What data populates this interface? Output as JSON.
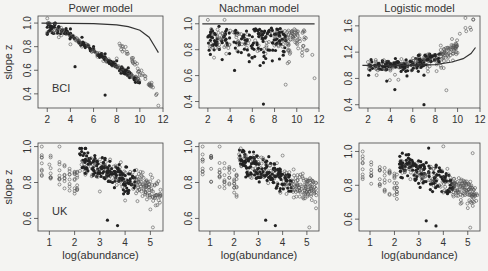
{
  "figure": {
    "row_labels": [
      "BCI",
      "UK"
    ],
    "column_titles": [
      "Power model",
      "Nachman model",
      "Logistic model"
    ],
    "ylabel": "slope z",
    "xlabel": "log(abundance)"
  },
  "chart_data": [
    {
      "type": "scatter",
      "title": "Power model",
      "panel_label": "BCI",
      "xlabel": "",
      "ylabel": "slope z",
      "xlim": [
        1.2,
        12
      ],
      "ylim": [
        0.28,
        1.06
      ],
      "xticks": [
        2,
        4,
        6,
        8,
        10,
        12
      ],
      "yticks": [
        0.4,
        0.6,
        0.8,
        1.0
      ],
      "series": [
        {
          "name": "filled points",
          "trend": "declining from ~1.0 at x=2 to ~0.6 at x=9.5",
          "example_points": [
            [
              3,
              0.97
            ],
            [
              4,
              0.95
            ],
            [
              5,
              0.88
            ],
            [
              6,
              0.8
            ],
            [
              7,
              0.74
            ],
            [
              8,
              0.68
            ],
            [
              9,
              0.62
            ],
            [
              4.4,
              0.63
            ],
            [
              7,
              0.39
            ]
          ]
        },
        {
          "name": "open points",
          "trend": "declining from ~1.0 at x=2 to ~0.3 at x=11.6",
          "example_points": [
            [
              2,
              1.04
            ],
            [
              2,
              0.92
            ],
            [
              3,
              0.88
            ],
            [
              4,
              0.82
            ],
            [
              6,
              0.78
            ],
            [
              8,
              0.7
            ],
            [
              9,
              0.58
            ],
            [
              10,
              0.56
            ],
            [
              10.8,
              0.48
            ],
            [
              11.4,
              0.39
            ],
            [
              11.6,
              0.3
            ]
          ]
        },
        {
          "name": "model curve",
          "type": "line",
          "points": [
            [
              1.5,
              1.0
            ],
            [
              6,
              0.995
            ],
            [
              8,
              0.985
            ],
            [
              9,
              0.97
            ],
            [
              10,
              0.94
            ],
            [
              10.8,
              0.88
            ],
            [
              11.3,
              0.8
            ],
            [
              11.6,
              0.75
            ]
          ]
        }
      ]
    },
    {
      "type": "scatter",
      "title": "Nachman model",
      "panel_label": "",
      "xlim": [
        1.2,
        12
      ],
      "ylim": [
        0.35,
        1.06
      ],
      "xticks": [
        2,
        4,
        6,
        8,
        10,
        12
      ],
      "yticks": [
        0.4,
        0.6,
        0.8,
        1.0
      ],
      "series": [
        {
          "name": "filled points",
          "trend": "cluster near 0.9-1.0 spreading to 0.65 around x=4-8",
          "example_points": [
            [
              3,
              0.98
            ],
            [
              4.5,
              0.95
            ],
            [
              6,
              0.9
            ],
            [
              7,
              0.7
            ],
            [
              4.4,
              0.64
            ],
            [
              7,
              0.38
            ]
          ]
        },
        {
          "name": "open points",
          "trend": "near 1.0, spreading down to 0.6 at high x",
          "example_points": [
            [
              2,
              1.03
            ],
            [
              3.5,
              1.03
            ],
            [
              8,
              0.9
            ],
            [
              10,
              0.85
            ],
            [
              11.4,
              0.76
            ],
            [
              9,
              0.53
            ],
            [
              11.6,
              0.58
            ]
          ]
        },
        {
          "name": "model curve",
          "type": "line",
          "points": [
            [
              1.5,
              1.0
            ],
            [
              11.6,
              1.0
            ]
          ]
        }
      ]
    },
    {
      "type": "scatter",
      "title": "Logistic model",
      "panel_label": "",
      "xlim": [
        1.2,
        12
      ],
      "ylim": [
        0.35,
        1.75
      ],
      "xticks": [
        2,
        4,
        6,
        8,
        10,
        12
      ],
      "yticks": [
        0.4,
        0.8,
        1.2,
        1.6
      ],
      "series": [
        {
          "name": "filled points",
          "trend": "around 1.0, rising to ~1.2 near x=6-8",
          "example_points": [
            [
              3,
              1.0
            ],
            [
              5,
              1.0
            ],
            [
              6.5,
              1.15
            ],
            [
              7,
              0.85
            ],
            [
              4.4,
              0.63
            ],
            [
              7,
              0.4
            ]
          ]
        },
        {
          "name": "open points",
          "trend": "around 1.0, rising to 1.7 at high x",
          "example_points": [
            [
              2,
              1.05
            ],
            [
              4,
              0.92
            ],
            [
              8.5,
              1.3
            ],
            [
              9.5,
              1.4
            ],
            [
              10.2,
              1.48
            ],
            [
              10.7,
              1.72
            ],
            [
              11.4,
              1.7
            ],
            [
              9,
              0.62
            ]
          ]
        },
        {
          "name": "model curve",
          "type": "line",
          "points": [
            [
              1.5,
              1.0
            ],
            [
              6,
              1.0
            ],
            [
              8,
              1.01
            ],
            [
              9.5,
              1.05
            ],
            [
              10.5,
              1.1
            ],
            [
              11.2,
              1.18
            ],
            [
              11.6,
              1.27
            ]
          ]
        }
      ]
    },
    {
      "type": "scatter",
      "title": "",
      "panel_label": "UK",
      "xlabel": "log(abundance)",
      "ylabel": "slope z",
      "xlim": [
        0.55,
        5.5
      ],
      "ylim": [
        0.53,
        1.02
      ],
      "xticks": [
        1,
        2,
        3,
        4,
        5
      ],
      "yticks": [
        0.6,
        0.8,
        1.0
      ],
      "series": [
        {
          "name": "filled points",
          "trend": "dense cloud 0.65-0.95 at x=2.5-4.5",
          "example_points": [
            [
              2.8,
              0.95
            ],
            [
              3,
              0.85
            ],
            [
              3.5,
              0.8
            ],
            [
              4,
              0.75
            ],
            [
              3.3,
              0.59
            ],
            [
              3.7,
              0.56
            ]
          ]
        },
        {
          "name": "open points",
          "trend": "declining from 1.0 at x=0.7 to ~0.6 at x=5.3",
          "example_points": [
            [
              0.7,
              1.0
            ],
            [
              1,
              0.9
            ],
            [
              1.4,
              1.0
            ],
            [
              2,
              0.85
            ],
            [
              3,
              0.75
            ],
            [
              4,
              0.7
            ],
            [
              5,
              0.65
            ],
            [
              5.1,
              0.55
            ]
          ]
        }
      ]
    },
    {
      "type": "scatter",
      "title": "",
      "panel_label": "",
      "xlabel": "log(abundance)",
      "xlim": [
        0.55,
        5.5
      ],
      "ylim": [
        0.53,
        1.02
      ],
      "xticks": [
        1,
        2,
        3,
        4,
        5
      ],
      "yticks": [
        0.6,
        0.8,
        1.0
      ],
      "series": [
        {
          "name": "filled points",
          "trend": "dense cloud 0.65-0.95 at x=2.5-4.5",
          "example_points": [
            [
              2.8,
              0.97
            ],
            [
              3.3,
              0.59
            ],
            [
              3.7,
              0.56
            ]
          ]
        },
        {
          "name": "open points",
          "trend": "declining from 1.0 to ~0.6",
          "example_points": [
            [
              0.7,
              1.0
            ],
            [
              1.4,
              1.0
            ],
            [
              4,
              0.95
            ],
            [
              5.1,
              0.55
            ]
          ]
        }
      ]
    },
    {
      "type": "scatter",
      "title": "",
      "panel_label": "",
      "xlabel": "log(abundance)",
      "xlim": [
        0.55,
        5.5
      ],
      "ylim": [
        0.53,
        1.05
      ],
      "xticks": [
        1,
        2,
        3,
        4,
        5
      ],
      "yticks": [
        0.6,
        0.8,
        1.0
      ],
      "series": [
        {
          "name": "filled points",
          "trend": "dense cloud 0.65-1.0 at x=2.5-4.5",
          "example_points": [
            [
              3.4,
              1.02
            ],
            [
              3.3,
              0.59
            ],
            [
              3.7,
              0.56
            ]
          ]
        },
        {
          "name": "open points",
          "trend": "declining from 1.0 to ~0.6",
          "example_points": [
            [
              0.7,
              1.0
            ],
            [
              4,
              1.03
            ],
            [
              5.2,
              0.99
            ],
            [
              5.1,
              0.55
            ]
          ]
        }
      ]
    }
  ]
}
